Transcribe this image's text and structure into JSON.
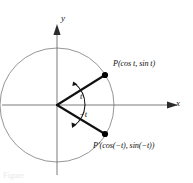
{
  "figure": {
    "type": "unit-circle-trigonometry-diagram",
    "background_color": "#ffffff",
    "caption": "Figure",
    "axes": {
      "x_label": "x",
      "y_label": "y",
      "origin": {
        "x": 57,
        "y": 105
      },
      "x_axis_color": "#6b6b6b",
      "y_axis_color": "#6b6b6b"
    },
    "circle": {
      "center_x": 57,
      "center_y": 105,
      "radius": 57,
      "stroke_color": "#8a8a8a"
    },
    "angles": {
      "positive_label": "t",
      "negative_label": "−t"
    },
    "points": [
      {
        "name": "P",
        "label": "P(cos t, sin t)",
        "label_prefix": "P",
        "label_body": "(cos t, sin t)",
        "dot_x": 105,
        "dot_y": 75,
        "color": "#000000"
      },
      {
        "name": "P-prime",
        "label": "P'(cos(−t), sin(−t))",
        "label_prefix": "P′",
        "label_body": "(cos(−t), sin(−t))",
        "dot_x": 105,
        "dot_y": 134,
        "color": "#000000"
      }
    ],
    "radii_color": "#111111"
  }
}
